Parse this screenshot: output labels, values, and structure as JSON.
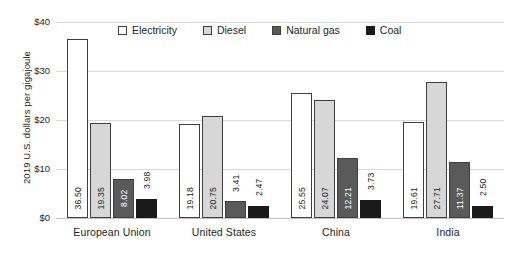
{
  "chart_data": {
    "type": "bar",
    "title": "",
    "subtitle": "",
    "xlabel": "",
    "ylabel": "2019 U.S. dollars per gigajoule",
    "ylim": [
      0,
      40
    ],
    "ytick_values": [
      40,
      30,
      20,
      10,
      0
    ],
    "ytick_labels": [
      "$40",
      "$30",
      "$20",
      "$10",
      "$0"
    ],
    "grid": true,
    "legend_position": "top-center",
    "categories": [
      "European Union",
      "United States",
      "China",
      "India"
    ],
    "series": [
      {
        "name": "Electricity",
        "color": "#ffffff",
        "values": [
          36.5,
          19.18,
          25.55,
          19.61
        ],
        "labels": [
          "36.50",
          "19.18",
          "25.55",
          "19.61"
        ]
      },
      {
        "name": "Diesel",
        "color": "#d7d7d7",
        "values": [
          19.35,
          20.75,
          24.07,
          27.71
        ],
        "labels": [
          "19.35",
          "20.75",
          "24.07",
          "27.71"
        ]
      },
      {
        "name": "Natural gas",
        "color": "#5a5a5a",
        "values": [
          8.02,
          3.41,
          12.21,
          11.37
        ],
        "labels": [
          "8.02",
          "3.41",
          "12.21",
          "11.37"
        ]
      },
      {
        "name": "Coal",
        "color": "#1a1a1a",
        "values": [
          3.98,
          2.47,
          3.73,
          2.5
        ],
        "labels": [
          "3.98",
          "2.47",
          "3.73",
          "2.50"
        ]
      }
    ]
  },
  "colors": {
    "axis": "#231f20",
    "gridline": "#d9d9d9",
    "baseline": "#bfbfbf",
    "bar_outline": "#3f3f3f",
    "background": "#ffffff"
  }
}
